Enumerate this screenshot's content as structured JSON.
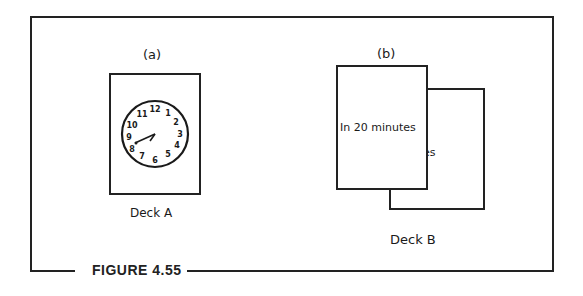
{
  "figure": {
    "caption": "FIGURE 4.55"
  },
  "panel_a": {
    "label": "(a)",
    "deck_label": "Deck A",
    "card": {
      "type": "clock-face",
      "numbers": [
        "12",
        "1",
        "2",
        "3",
        "4",
        "5",
        "6",
        "7",
        "8",
        "9",
        "10",
        "11"
      ],
      "hour_hand_points_to": "8",
      "minute_hand_points_to": "8"
    }
  },
  "panel_b": {
    "label": "(b)",
    "deck_label": "Deck B",
    "front_card_text": "In 20 minutes",
    "back_card_text_line1": "minutes",
    "back_card_text_line2": "ago"
  }
}
